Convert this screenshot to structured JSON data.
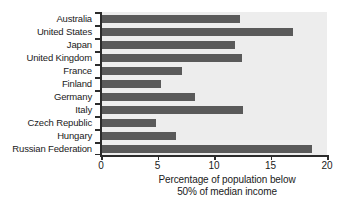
{
  "chart_data": {
    "type": "bar",
    "orientation": "horizontal",
    "title": "",
    "xlabel": "Percentage of population below 50% of median income",
    "xlabel_lines": [
      "Percentage of population below",
      "50% of median income"
    ],
    "ylabel": "",
    "xlim": [
      0,
      20
    ],
    "xticks": [
      0,
      5,
      10,
      15,
      20
    ],
    "xtick_labels": [
      "0",
      "5",
      "10",
      "15",
      "20"
    ],
    "grid": false,
    "legend": false,
    "categories": [
      "Australia",
      "United States",
      "Japan",
      "United Kingdom",
      "France",
      "Finland",
      "Germany",
      "Italy",
      "Czech Republic",
      "Hungary",
      "Russian Federation"
    ],
    "values": [
      12.3,
      17.0,
      11.9,
      12.5,
      7.2,
      5.3,
      8.3,
      12.6,
      4.9,
      6.6,
      18.7
    ],
    "series": [
      {
        "name": "Percentage of population below 50% of median income",
        "values": [
          12.3,
          17.0,
          11.9,
          12.5,
          7.2,
          5.3,
          8.3,
          12.6,
          4.9,
          6.6,
          18.7
        ]
      }
    ],
    "colors": {
      "bar": "#5a5a5a",
      "plot_background": "#ededed",
      "axis": "#2b2b2b",
      "text": "#1a1a1a",
      "figure_background": "#ffffff"
    }
  }
}
